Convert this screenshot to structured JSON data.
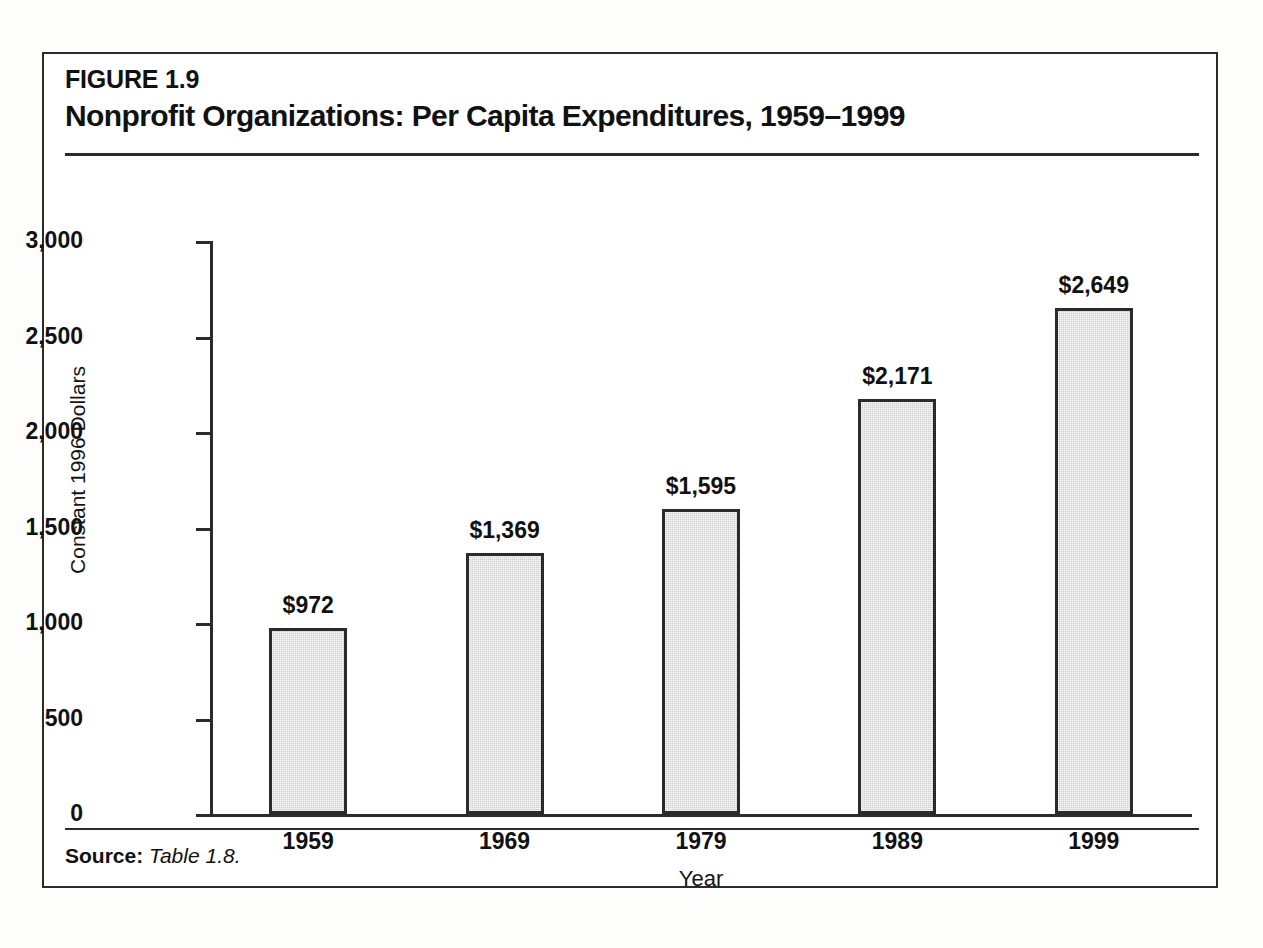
{
  "figure": {
    "number": "FIGURE 1.9",
    "title": "Nonprofit Organizations: Per Capita Expenditures, 1959–1999",
    "source_label": "Source:",
    "source_text": "Table 1.8."
  },
  "chart_data": {
    "type": "bar",
    "title": "Nonprofit Organizations: Per Capita Expenditures, 1959–1999",
    "xlabel": "Year",
    "ylabel": "Constant 1996 Dollars",
    "categories": [
      "1959",
      "1969",
      "1979",
      "1989",
      "1999"
    ],
    "values": [
      972,
      1369,
      1595,
      2171,
      2649
    ],
    "value_labels": [
      "$972",
      "$1,369",
      "$1,595",
      "$2,171",
      "$2,649"
    ],
    "ylim": [
      0,
      3000
    ],
    "ytick_values": [
      0,
      500,
      1000,
      1500,
      2000,
      2500,
      3000
    ],
    "ytick_labels": [
      "0",
      "500",
      "1,000",
      "1,500",
      "2,000",
      "2,500",
      "3,000"
    ],
    "grid": false,
    "legend": null,
    "series": [
      {
        "name": "Per Capita Expenditures",
        "values": [
          972,
          1369,
          1595,
          2171,
          2649
        ]
      }
    ],
    "colors": {
      "bar_fill": "#cfcfcf",
      "bar_border": "#2b2b2b",
      "axis": "#2b2b2b",
      "text": "#111111",
      "background": "#ffffff"
    }
  }
}
